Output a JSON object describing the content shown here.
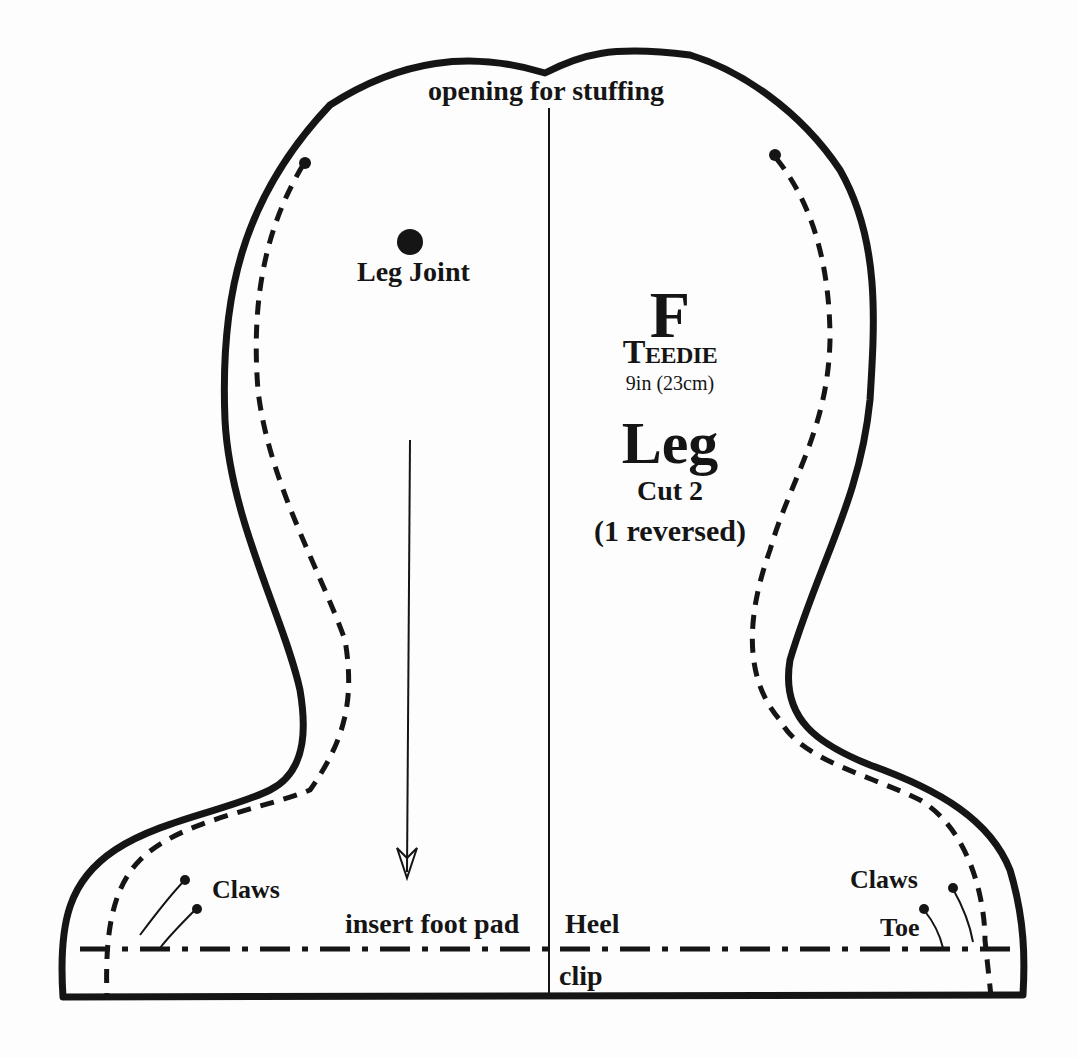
{
  "pattern": {
    "piece_letter": "F",
    "bear_name": "Teedie",
    "bear_size": "9in (23cm)",
    "piece_name": "Leg",
    "cut_instruction": "Cut 2",
    "cut_note": "(1 reversed)",
    "colors": {
      "ink": "#151515",
      "paper": "#fdfdfd"
    }
  },
  "labels": {
    "opening": "opening for stuffing",
    "leg_joint": "Leg Joint",
    "claws_left": "Claws",
    "claws_right": "Claws",
    "insert_foot_pad": "insert foot pad",
    "heel": "Heel",
    "toe": "Toe",
    "clip": "clip"
  },
  "icons": {
    "grain_arrow": "arrow-down-icon",
    "joint_marker": "filled-circle-icon",
    "stitch_endpoint": "dot-icon"
  }
}
